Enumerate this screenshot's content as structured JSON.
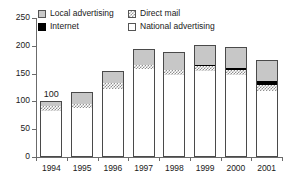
{
  "chart_data": {
    "type": "bar",
    "subtype": "stacked-vertical",
    "title": "",
    "xlabel": "",
    "ylabel": "",
    "ylim": [
      0,
      250
    ],
    "yticks": [
      0,
      50,
      100,
      150,
      200,
      250
    ],
    "grid": false,
    "legend_position": "top-inside",
    "categories": [
      "1994",
      "1995",
      "1996",
      "1997",
      "1998",
      "1999",
      "2000",
      "2001"
    ],
    "series": [
      {
        "name": "National advertising",
        "values": [
          82,
          88,
          122,
          158,
          147,
          155,
          148,
          119
        ]
      },
      {
        "name": "Direct mail",
        "values": [
          10,
          8,
          11,
          8,
          10,
          8,
          8,
          11
        ]
      },
      {
        "name": "Internet",
        "values": [
          0,
          0,
          0,
          0,
          0,
          3,
          4,
          7
        ]
      },
      {
        "name": "Local advertising",
        "values": [
          8,
          21,
          22,
          29,
          31,
          36,
          37,
          37
        ]
      }
    ],
    "totals": [
      100,
      117,
      155,
      195,
      188,
      202,
      197,
      174
    ],
    "annotations": [
      {
        "category": "1994",
        "text": "100",
        "position": "above-bar"
      }
    ]
  },
  "legend": {
    "items": [
      {
        "label": "Local advertising",
        "swatch": "legend-swatch-local-advertising",
        "color": "#c9c9c9",
        "pattern": "solid-gray"
      },
      {
        "label": "Direct mail",
        "swatch": "legend-swatch-direct-mail",
        "color": "#9a9a9a",
        "pattern": "checker-hatch"
      },
      {
        "label": "Internet",
        "swatch": "legend-swatch-internet",
        "color": "#000000",
        "pattern": "solid-black"
      },
      {
        "label": "National advertising",
        "swatch": "legend-swatch-national-advertising",
        "color": "#ffffff",
        "pattern": "outline-white"
      }
    ]
  },
  "axes": {
    "y_tick_labels": [
      "250",
      "200",
      "150",
      "100",
      "50",
      "0"
    ],
    "x_tick_labels": [
      "1994",
      "1995",
      "1996",
      "1997",
      "1998",
      "1999",
      "2000",
      "2001"
    ]
  }
}
